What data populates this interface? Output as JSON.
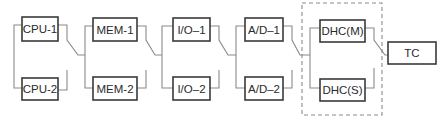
{
  "diagram": {
    "type": "redundant-chain block diagram",
    "stages": [
      {
        "name": "CPU",
        "primary": "CPU-1",
        "secondary": "CPU-2"
      },
      {
        "name": "MEM",
        "primary": "MEM-1",
        "secondary": "MEM-2"
      },
      {
        "name": "I/O",
        "primary": "I/O–1",
        "secondary": "I/O–2"
      },
      {
        "name": "A/D",
        "primary": "A/D–1",
        "secondary": "A/D–2"
      },
      {
        "name": "DHC",
        "primary": "DHC(M)",
        "secondary": "DHC(S)",
        "grouped_dashed": true
      }
    ],
    "output": {
      "label": "TC"
    },
    "colors": {
      "box_border": "#3a3a3a",
      "wire": "#8a8a8a",
      "background": "#ffffff"
    }
  }
}
